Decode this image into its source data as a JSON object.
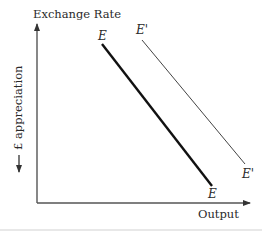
{
  "diagram": {
    "y_axis_title": "Exchange Rate",
    "x_axis_title": "Output",
    "y_side_label": "£ appreciation",
    "curves": [
      {
        "name": "E",
        "label_top": "E",
        "label_bottom": "E",
        "style": "thick"
      },
      {
        "name": "E'",
        "label_top": "E'",
        "label_bottom": "E'",
        "style": "thin"
      }
    ]
  },
  "colors": {
    "axis": "#555555",
    "curve_E": "#111111",
    "curve_E_prime": "#444444",
    "text": "#2a2a2a"
  }
}
